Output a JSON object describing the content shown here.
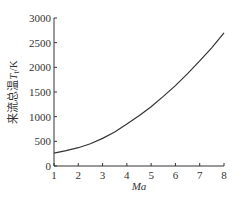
{
  "chart_data": {
    "type": "line",
    "title": "",
    "xlabel": "Ma",
    "ylabel": "来流总温 T_t /K",
    "ylabel_parts": {
      "text": "来流总温",
      "symbol": "T",
      "subscript": "t",
      "unit": "/K"
    },
    "xlim": [
      1,
      8
    ],
    "ylim": [
      0,
      3000
    ],
    "x_ticks": [
      1,
      2,
      3,
      4,
      5,
      6,
      7,
      8
    ],
    "y_ticks": [
      0,
      500,
      1000,
      1500,
      2000,
      2500,
      3000
    ],
    "grid": false,
    "legend": null,
    "series": [
      {
        "name": "来流总温",
        "x": [
          1,
          1.5,
          2,
          2.5,
          3,
          3.5,
          4,
          4.5,
          5,
          5.5,
          6,
          6.5,
          7,
          7.5,
          8
        ],
        "values": [
          260,
          310,
          370,
          450,
          560,
          690,
          850,
          1020,
          1200,
          1410,
          1630,
          1870,
          2130,
          2400,
          2700
        ]
      }
    ]
  }
}
